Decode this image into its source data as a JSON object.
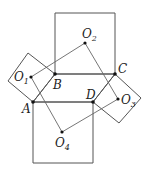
{
  "diagram": {
    "stroke_color": "#555555",
    "point_color": "#111111",
    "points": {
      "A": {
        "label": "A",
        "x": 33,
        "y": 102
      },
      "B": {
        "label": "B",
        "x": 55,
        "y": 74
      },
      "C": {
        "label": "C",
        "x": 115,
        "y": 74
      },
      "D": {
        "label": "D",
        "x": 93,
        "y": 102
      },
      "O1": {
        "label": "O",
        "sub": "1",
        "x": 31,
        "y": 77
      },
      "O2": {
        "label": "O",
        "sub": "2",
        "x": 85,
        "y": 43
      },
      "O3": {
        "label": "O",
        "sub": "3",
        "x": 118,
        "y": 99
      },
      "O4": {
        "label": "O",
        "sub": "4",
        "x": 62,
        "y": 132
      }
    },
    "squares": [
      {
        "name": "square-on-AB",
        "vertices": [
          [
            33,
            102
          ],
          [
            55,
            74
          ],
          [
            28,
            53
          ],
          [
            8,
            81
          ]
        ]
      },
      {
        "name": "square-on-BC",
        "vertices": [
          [
            55,
            74
          ],
          [
            115,
            74
          ],
          [
            115,
            13
          ],
          [
            55,
            13
          ]
        ]
      },
      {
        "name": "square-on-CD",
        "vertices": [
          [
            115,
            74
          ],
          [
            141,
            98
          ],
          [
            119,
            123
          ],
          [
            93,
            102
          ]
        ]
      },
      {
        "name": "square-on-DA",
        "vertices": [
          [
            33,
            102
          ],
          [
            93,
            102
          ],
          [
            93,
            163
          ],
          [
            33,
            163
          ]
        ]
      }
    ],
    "center_quadrilateral": [
      "O1",
      "O2",
      "O3",
      "O4"
    ]
  }
}
